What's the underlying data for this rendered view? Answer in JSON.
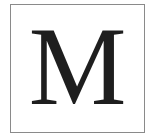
{
  "tile": {
    "letter": "M",
    "border_color": "#8a8a8a",
    "letter_color": "#1e1e1e",
    "background_color": "#ffffff"
  }
}
